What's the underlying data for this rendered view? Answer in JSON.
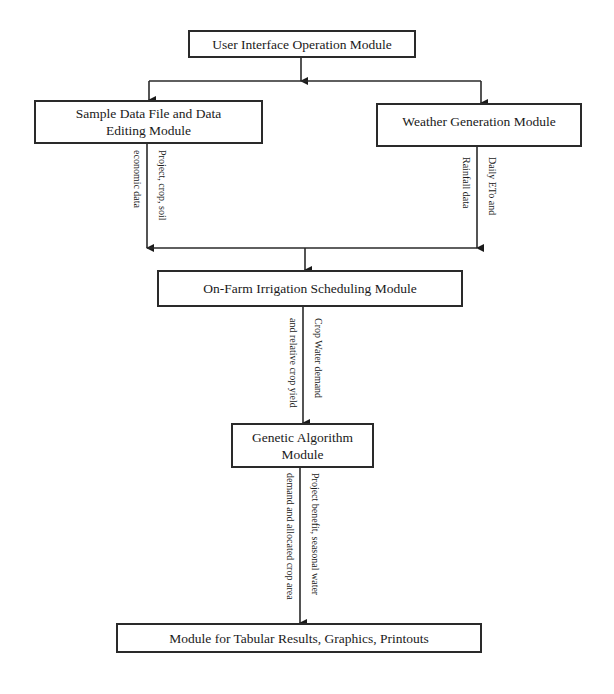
{
  "diagram": {
    "nodes": {
      "ui": {
        "label": "User Interface Operation Module"
      },
      "sample": {
        "label": "Sample Data File and Data Editing Module"
      },
      "weather": {
        "label": "Weather Generation Module"
      },
      "onfarm": {
        "label": "On-Farm Irrigation Scheduling Module"
      },
      "genetic": {
        "label": "Genetic Algorithm Module"
      },
      "results": {
        "label": "Module for Tabular Results, Graphics, Printouts"
      }
    },
    "edge_labels": {
      "sample_right": "Project, crop, soil",
      "sample_left": "economic data",
      "weather_right": "Daily ETo and",
      "weather_left": "Rainfall data",
      "onfarm_right": "Crop Water demand",
      "onfarm_left": "and relative crop yield",
      "genetic_right": "Project benefit, seasonal water",
      "genetic_left": "demand and allocated crop area"
    },
    "edges": [
      {
        "from": "ui",
        "to": "sample"
      },
      {
        "from": "ui",
        "to": "weather"
      },
      {
        "from": "sample",
        "to": "onfarm"
      },
      {
        "from": "weather",
        "to": "onfarm"
      },
      {
        "from": "onfarm",
        "to": "genetic"
      },
      {
        "from": "genetic",
        "to": "results"
      }
    ]
  }
}
